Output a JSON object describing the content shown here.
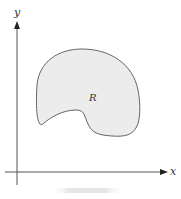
{
  "diagram": {
    "axes": {
      "x_label": "x",
      "y_label": "y"
    },
    "region": {
      "label": "R",
      "fill_color": "#ececec",
      "stroke_color": "#666666"
    },
    "colors": {
      "axis": "#555555",
      "text": "#333333"
    }
  }
}
